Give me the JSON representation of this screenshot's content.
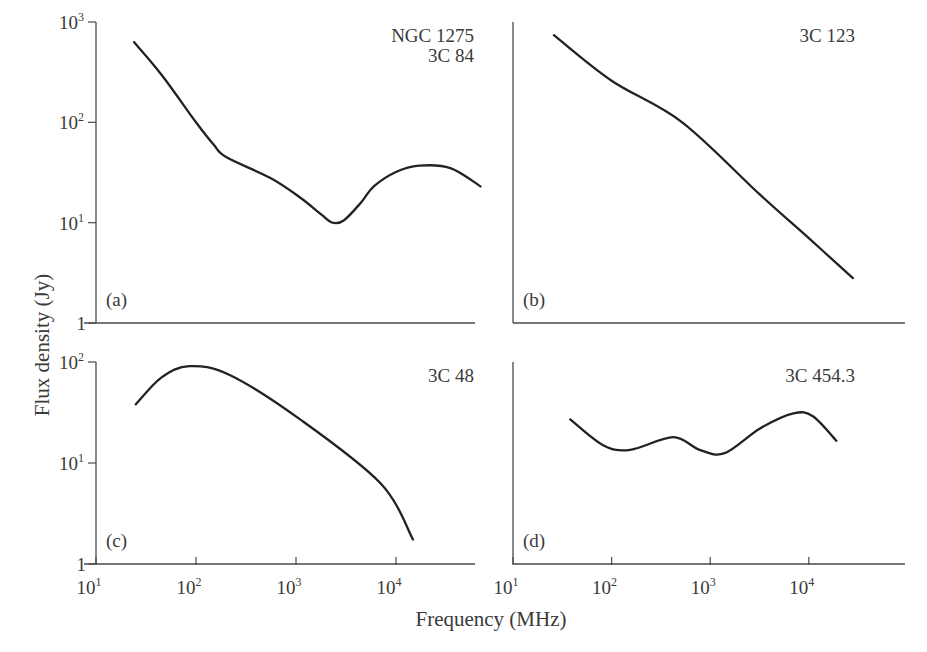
{
  "chart_data": {
    "type": "line",
    "xlabel": "Frequency (MHz)",
    "ylabel": "Flux density (Jy)",
    "x_scale": "log",
    "y_scale": "log",
    "xlim": [
      10,
      100000
    ],
    "x_ticks": [
      {
        "value": 10,
        "base": "10",
        "exp": "1"
      },
      {
        "value": 100,
        "base": "10",
        "exp": "2"
      },
      {
        "value": 1000,
        "base": "10",
        "exp": "3"
      },
      {
        "value": 10000,
        "base": "10",
        "exp": "4"
      }
    ],
    "grid": false,
    "panels": [
      {
        "id": "a",
        "panel_label": "(a)",
        "source_labels": [
          "NGC 1275",
          "3C 84"
        ],
        "ylim": [
          1,
          1000
        ],
        "y_ticks": [
          {
            "value": 1,
            "base": "1",
            "exp": ""
          },
          {
            "value": 10,
            "base": "10",
            "exp": "1"
          },
          {
            "value": 100,
            "base": "10",
            "exp": "2"
          },
          {
            "value": 1000,
            "base": "10",
            "exp": "3"
          }
        ],
        "series": [
          {
            "name": "NGC 1275 / 3C 84",
            "x": [
              24,
              45,
              100,
              150,
              200,
              550,
              1100,
              1800,
              2300,
              3000,
              4500,
              6000,
              10000,
              17000,
              35000,
              70000
            ],
            "y": [
              630,
              300,
              100,
              60,
              45,
              28,
              17.8,
              12,
              10,
              10.5,
              16,
              23,
              32,
              37,
              35,
              23
            ]
          }
        ]
      },
      {
        "id": "b",
        "panel_label": "(b)",
        "source_labels": [
          "3C 123"
        ],
        "ylim": [
          1,
          1000
        ],
        "y_ticks": [],
        "series": [
          {
            "name": "3C 123",
            "x": [
              26,
              100,
              520,
              3200,
              10000,
              28000
            ],
            "y": [
              740,
              260,
              100,
              19,
              7,
              2.8
            ]
          }
        ]
      },
      {
        "id": "c",
        "panel_label": "(c)",
        "source_labels": [
          "3C 48"
        ],
        "ylim": [
          1,
          100
        ],
        "y_ticks": [
          {
            "value": 1,
            "base": "1",
            "exp": ""
          },
          {
            "value": 10,
            "base": "10",
            "exp": "1"
          },
          {
            "value": 100,
            "base": "10",
            "exp": "2"
          }
        ],
        "series": [
          {
            "name": "3C 48",
            "x": [
              25,
              45,
              86,
              220,
              1100,
              7000,
              14800
            ],
            "y": [
              38,
              70,
              91,
              74,
              27,
              6.3,
              1.75
            ]
          }
        ]
      },
      {
        "id": "d",
        "panel_label": "(d)",
        "source_labels": [
          "3C 454.3"
        ],
        "ylim": [
          1,
          100
        ],
        "y_ticks": [],
        "series": [
          {
            "name": "3C 454.3",
            "x": [
              38,
              82,
              155,
              420,
              780,
              1400,
              3200,
              7000,
              11000,
              19000
            ],
            "y": [
              27,
              15,
              13.5,
              18,
              13.5,
              12.5,
              22,
              31,
              29,
              16.6
            ]
          }
        ]
      }
    ]
  }
}
